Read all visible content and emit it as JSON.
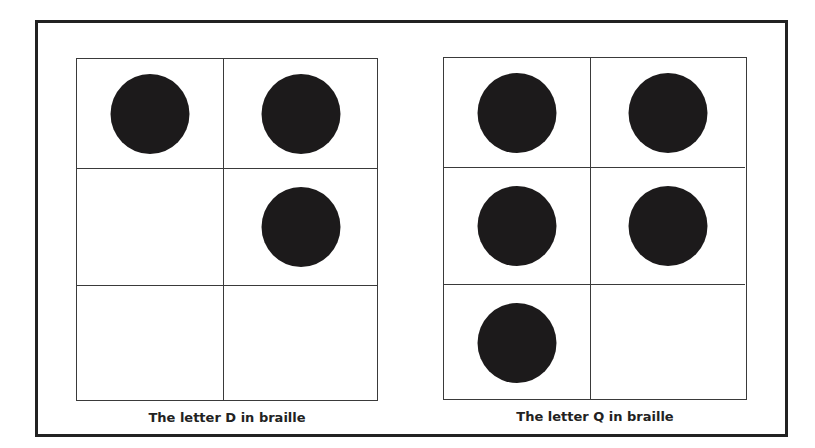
{
  "figure": {
    "panels": [
      {
        "letter": "D",
        "caption": "The letter D in braille",
        "cells": [
          {
            "row": 0,
            "col": 0,
            "dot": true
          },
          {
            "row": 0,
            "col": 1,
            "dot": true
          },
          {
            "row": 1,
            "col": 0,
            "dot": false
          },
          {
            "row": 1,
            "col": 1,
            "dot": true
          },
          {
            "row": 2,
            "col": 0,
            "dot": false
          },
          {
            "row": 2,
            "col": 1,
            "dot": false
          }
        ]
      },
      {
        "letter": "Q",
        "caption": "The letter Q in braille",
        "cells": [
          {
            "row": 0,
            "col": 0,
            "dot": true
          },
          {
            "row": 0,
            "col": 1,
            "dot": true
          },
          {
            "row": 1,
            "col": 0,
            "dot": true
          },
          {
            "row": 1,
            "col": 1,
            "dot": true
          },
          {
            "row": 2,
            "col": 0,
            "dot": true
          },
          {
            "row": 2,
            "col": 1,
            "dot": false
          }
        ]
      }
    ],
    "colors": {
      "dot": "#1c1a1b",
      "grid_line": "#3a3a3a",
      "frame": "#222222",
      "background": "#ffffff"
    }
  }
}
